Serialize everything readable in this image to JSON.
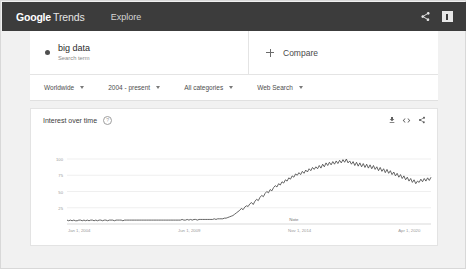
{
  "appbar": {
    "brand_google": "Google",
    "brand_trends": "Trends",
    "nav_explore": "Explore",
    "share_icon": "share-icon",
    "feedback_icon": "feedback-flag-icon"
  },
  "query": {
    "term": "big data",
    "type_label": "Search term",
    "compare_label": "Compare",
    "add_icon": "plus-icon"
  },
  "filters": [
    {
      "label": "Worldwide",
      "name": "location-filter"
    },
    {
      "label": "2004 - present",
      "name": "time-range-filter"
    },
    {
      "label": "All categories",
      "name": "category-filter"
    },
    {
      "label": "Web Search",
      "name": "search-type-filter"
    }
  ],
  "chart_card": {
    "title": "Interest over time",
    "help_icon": "help-circle-icon",
    "help_glyph": "?",
    "download_icon": "download-icon",
    "embed_icon": "embed-code-icon",
    "share_icon": "share-icon"
  },
  "chart_data": {
    "type": "line",
    "title": "Interest over time",
    "xlabel": "",
    "ylabel": "",
    "ylim": [
      0,
      100
    ],
    "yticks": [
      25,
      50,
      75,
      100
    ],
    "grid": true,
    "legend": false,
    "line_color": "#4a4a4a",
    "annotations": [
      {
        "label": "Note",
        "x_index": 134
      }
    ],
    "xticks": [
      {
        "label": "Jan 1, 2004",
        "index": 0
      },
      {
        "label": "Jun 1, 2009",
        "index": 65
      },
      {
        "label": "Nov 1, 2014",
        "index": 130
      },
      {
        "label": "Apr 1, 2020",
        "index": 195
      }
    ],
    "series": [
      {
        "name": "big data",
        "values": [
          6,
          5,
          6,
          5,
          6,
          5,
          5,
          6,
          6,
          5,
          6,
          5,
          6,
          5,
          6,
          6,
          5,
          6,
          5,
          6,
          6,
          5,
          6,
          6,
          5,
          6,
          6,
          6,
          5,
          6,
          6,
          6,
          6,
          5,
          6,
          6,
          6,
          6,
          6,
          6,
          6,
          6,
          6,
          6,
          6,
          6,
          6,
          6,
          6,
          6,
          6,
          6,
          6,
          6,
          6,
          6,
          6,
          6,
          6,
          6,
          6,
          6,
          6,
          6,
          6,
          6,
          6,
          6,
          7,
          6,
          6,
          7,
          6,
          7,
          6,
          7,
          7,
          6,
          7,
          7,
          7,
          7,
          7,
          7,
          7,
          7,
          7,
          8,
          7,
          8,
          8,
          8,
          8,
          9,
          9,
          10,
          11,
          12,
          13,
          15,
          17,
          19,
          21,
          24,
          22,
          26,
          28,
          27,
          31,
          33,
          30,
          35,
          38,
          36,
          41,
          44,
          42,
          47,
          50,
          48,
          53,
          51,
          56,
          59,
          57,
          62,
          60,
          65,
          63,
          68,
          66,
          71,
          69,
          74,
          72,
          77,
          75,
          79,
          76,
          81,
          78,
          83,
          80,
          85,
          82,
          87,
          84,
          88,
          85,
          90,
          86,
          92,
          88,
          94,
          90,
          95,
          91,
          96,
          92,
          97,
          93,
          98,
          94,
          99,
          95,
          100,
          94,
          97,
          92,
          96,
          90,
          95,
          89,
          94,
          88,
          93,
          87,
          92,
          86,
          91,
          85,
          90,
          84,
          88,
          82,
          87,
          81,
          85,
          79,
          84,
          78,
          82,
          76,
          80,
          74,
          78,
          72,
          76,
          70,
          74,
          68,
          72,
          66,
          70,
          64,
          68,
          62,
          66,
          64,
          69,
          65,
          70,
          66,
          71,
          67,
          72
        ]
      }
    ]
  }
}
